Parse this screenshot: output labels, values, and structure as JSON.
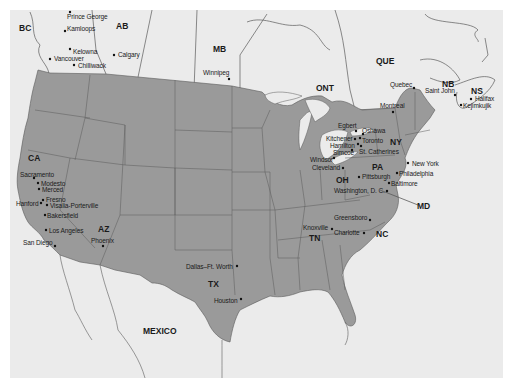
{
  "map": {
    "colors": {
      "background": "#ffffff",
      "land_other": "#ebebeb",
      "usa_fill": "#9a9a9a",
      "border": "#555555",
      "water": "#ebebeb"
    },
    "regions": [
      {
        "id": "bc",
        "label": "BC",
        "x": 19,
        "y": 24
      },
      {
        "id": "ab",
        "label": "AB",
        "x": 116,
        "y": 22
      },
      {
        "id": "mb",
        "label": "MB",
        "x": 213,
        "y": 45
      },
      {
        "id": "ont",
        "label": "ONT",
        "x": 316,
        "y": 84
      },
      {
        "id": "que",
        "label": "QUE",
        "x": 376,
        "y": 57
      },
      {
        "id": "nb",
        "label": "NB",
        "x": 442,
        "y": 80
      },
      {
        "id": "ns",
        "label": "NS",
        "x": 471,
        "y": 87
      },
      {
        "id": "ca",
        "label": "CA",
        "x": 28,
        "y": 154
      },
      {
        "id": "az",
        "label": "AZ",
        "x": 98,
        "y": 225
      },
      {
        "id": "tx",
        "label": "TX",
        "x": 208,
        "y": 280
      },
      {
        "id": "ny",
        "label": "NY",
        "x": 390,
        "y": 138
      },
      {
        "id": "pa",
        "label": "PA",
        "x": 372,
        "y": 163
      },
      {
        "id": "oh",
        "label": "OH",
        "x": 336,
        "y": 176
      },
      {
        "id": "md",
        "label": "MD",
        "x": 417,
        "y": 202
      },
      {
        "id": "tn",
        "label": "TN",
        "x": 309,
        "y": 234
      },
      {
        "id": "nc",
        "label": "NC",
        "x": 376,
        "y": 230
      },
      {
        "id": "mexico",
        "label": "MEXICO",
        "x": 143,
        "y": 327
      }
    ],
    "cities": [
      {
        "name": "Prince George",
        "lx": 67,
        "ly": 14,
        "dx": 70,
        "dy": 12
      },
      {
        "name": "Kamloops",
        "lx": 67,
        "ly": 26,
        "dx": 65,
        "dy": 31
      },
      {
        "name": "Kelowna",
        "lx": 73,
        "ly": 49,
        "dx": 70,
        "dy": 49
      },
      {
        "name": "Vancouver",
        "lx": 54,
        "ly": 56,
        "dx": 50,
        "dy": 59
      },
      {
        "name": "Chilliwack",
        "lx": 78,
        "ly": 63,
        "dx": 74,
        "dy": 65
      },
      {
        "name": "Calgary",
        "lx": 118,
        "ly": 52,
        "dx": 114,
        "dy": 55
      },
      {
        "name": "Winnipeg",
        "lx": 203,
        "ly": 70,
        "dx": 229,
        "dy": 79
      },
      {
        "name": "Quebec",
        "lx": 390,
        "ly": 82,
        "dx": 414,
        "dy": 88
      },
      {
        "name": "Saint John",
        "lx": 425,
        "ly": 88,
        "dx": 455,
        "dy": 95
      },
      {
        "name": "Halifax",
        "lx": 475,
        "ly": 96,
        "dx": 471,
        "dy": 99
      },
      {
        "name": "Kejimkujik",
        "lx": 463,
        "ly": 103,
        "dx": 461,
        "dy": 105
      },
      {
        "name": "Montreal",
        "lx": 380,
        "ly": 103,
        "dx": 393,
        "dy": 112
      },
      {
        "name": "Egbert",
        "lx": 338,
        "ly": 123,
        "dx": 356,
        "dy": 131
      },
      {
        "name": "Oshawa",
        "lx": 362,
        "ly": 128,
        "dx": 363,
        "dy": 134
      },
      {
        "name": "Kitchener",
        "lx": 326,
        "ly": 136,
        "dx": 355,
        "dy": 139
      },
      {
        "name": "Toronto",
        "lx": 362,
        "ly": 138,
        "dx": 360,
        "dy": 138
      },
      {
        "name": "Hamilton",
        "lx": 330,
        "ly": 143,
        "dx": 358,
        "dy": 144
      },
      {
        "name": "Simcoe",
        "lx": 333,
        "ly": 150,
        "dx": 352,
        "dy": 150
      },
      {
        "name": "St. Catherines",
        "lx": 359,
        "ly": 149,
        "dx": 361,
        "dy": 146
      },
      {
        "name": "Windsor",
        "lx": 310,
        "ly": 157,
        "dx": 334,
        "dy": 158
      },
      {
        "name": "Cleveland",
        "lx": 312,
        "ly": 165,
        "dx": 343,
        "dy": 168
      },
      {
        "name": "Pittsburgh",
        "lx": 362,
        "ly": 174,
        "dx": 359,
        "dy": 177
      },
      {
        "name": "New York",
        "lx": 412,
        "ly": 161,
        "dx": 408,
        "dy": 163
      },
      {
        "name": "Philadelphia",
        "lx": 399,
        "ly": 171,
        "dx": 397,
        "dy": 173
      },
      {
        "name": "Baltimore",
        "lx": 391,
        "ly": 181,
        "dx": 389,
        "dy": 183
      },
      {
        "name": "Washington, D. C.",
        "lx": 334,
        "ly": 188,
        "dx": 387,
        "dy": 191
      },
      {
        "name": "Greensboro",
        "lx": 334,
        "ly": 215,
        "dx": 370,
        "dy": 220
      },
      {
        "name": "Knoxville",
        "lx": 303,
        "ly": 225,
        "dx": 332,
        "dy": 229
      },
      {
        "name": "Charlotte",
        "lx": 334,
        "ly": 230,
        "dx": 364,
        "dy": 233
      },
      {
        "name": "Sacramento",
        "lx": 20,
        "ly": 172,
        "dx": 34,
        "dy": 178
      },
      {
        "name": "Modesto",
        "lx": 41,
        "ly": 181,
        "dx": 38,
        "dy": 183
      },
      {
        "name": "Merced",
        "lx": 42,
        "ly": 187,
        "dx": 39,
        "dy": 189
      },
      {
        "name": "Fresno",
        "lx": 46,
        "ly": 197,
        "dx": 43,
        "dy": 200
      },
      {
        "name": "Hanford",
        "lx": 16,
        "ly": 201,
        "dx": 41,
        "dy": 203
      },
      {
        "name": "Visalia-Porterville",
        "lx": 50,
        "ly": 203,
        "dx": 47,
        "dy": 205
      },
      {
        "name": "Bakersfield",
        "lx": 47,
        "ly": 213,
        "dx": 45,
        "dy": 215
      },
      {
        "name": "Los Angeles",
        "lx": 49,
        "ly": 228,
        "dx": 46,
        "dy": 230
      },
      {
        "name": "San Diego",
        "lx": 23,
        "ly": 240,
        "dx": 55,
        "dy": 246
      },
      {
        "name": "Phoenix",
        "lx": 91,
        "ly": 238,
        "dx": 103,
        "dy": 246
      },
      {
        "name": "Dallas–Ft. Worth",
        "lx": 186,
        "ly": 264,
        "dx": 237,
        "dy": 266
      },
      {
        "name": "Houston",
        "lx": 214,
        "ly": 298,
        "dx": 241,
        "dy": 299
      }
    ]
  }
}
